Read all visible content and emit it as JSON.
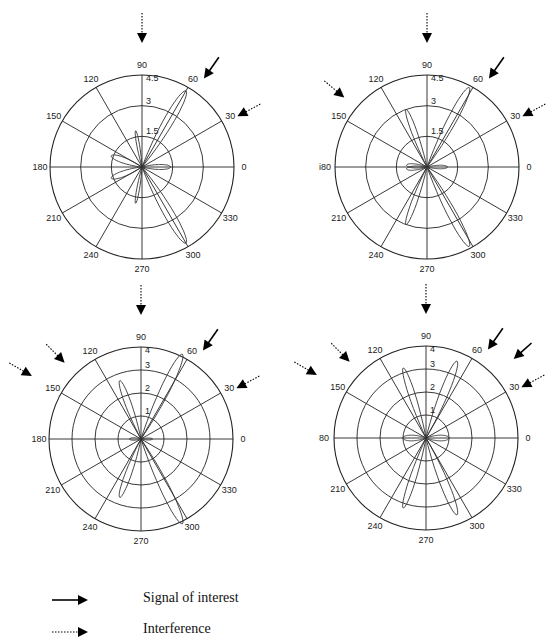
{
  "figure": {
    "legend": [
      {
        "style": "solid",
        "label": "Signal of interest"
      },
      {
        "style": "dotted",
        "label": "Interference"
      }
    ]
  },
  "chart_data": [
    {
      "type": "polar",
      "id": "plot-top-left",
      "center": [
        142,
        167
      ],
      "radius": 92,
      "angle_ticks": [
        "0",
        "30",
        "60",
        "90",
        "120",
        "150",
        "180",
        "210",
        "240",
        "270",
        "300",
        "330"
      ],
      "radial_ticks": [
        "1.5",
        "3",
        "4.5"
      ],
      "rmax": 4.5,
      "arrows": [
        {
          "type": "interference",
          "angle_deg": 90
        },
        {
          "type": "signal",
          "angle_deg": 55
        },
        {
          "type": "interference",
          "angle_deg": 28
        }
      ],
      "lobes": [
        {
          "angle": 60,
          "r": 4.3,
          "width": 9
        },
        {
          "angle": 300,
          "r": 4.3,
          "width": 9
        },
        {
          "angle": 100,
          "r": 1.8,
          "width": 6
        },
        {
          "angle": 260,
          "r": 1.8,
          "width": 6
        },
        {
          "angle": 160,
          "r": 1.6,
          "width": 14
        },
        {
          "angle": 200,
          "r": 1.6,
          "width": 14
        },
        {
          "angle": 0,
          "r": 1.4,
          "width": 14
        }
      ]
    },
    {
      "type": "polar",
      "id": "plot-top-right",
      "center": [
        427,
        167
      ],
      "radius": 92,
      "angle_ticks": [
        "0",
        "30",
        "60",
        "90",
        "120",
        "150",
        "i80",
        "210",
        "240",
        "270",
        "300",
        "330"
      ],
      "radial_ticks": [
        "1.5",
        "3",
        "4.5"
      ],
      "rmax": 4.5,
      "arrows": [
        {
          "type": "interference",
          "angle_deg": 90
        },
        {
          "type": "signal",
          "angle_deg": 55
        },
        {
          "type": "interference",
          "angle_deg": 28
        },
        {
          "type": "interference",
          "angle_deg": 140
        }
      ],
      "lobes": [
        {
          "angle": 62,
          "r": 4.4,
          "width": 8
        },
        {
          "angle": 298,
          "r": 4.4,
          "width": 8
        },
        {
          "angle": 110,
          "r": 3.0,
          "width": 7
        },
        {
          "angle": 250,
          "r": 3.0,
          "width": 7
        },
        {
          "angle": 175,
          "r": 1.0,
          "width": 16
        },
        {
          "angle": 185,
          "r": 1.0,
          "width": 16
        },
        {
          "angle": 0,
          "r": 1.0,
          "width": 14
        }
      ]
    },
    {
      "type": "polar",
      "id": "plot-bottom-left",
      "center": [
        141,
        439
      ],
      "radius": 92,
      "angle_ticks": [
        "0",
        "30",
        "60",
        "90",
        "120",
        "150",
        "180",
        "210",
        "240",
        "270",
        "300",
        "330"
      ],
      "radial_ticks": [
        "1",
        "2",
        "3",
        "4"
      ],
      "rmax": 4,
      "arrows": [
        {
          "type": "interference",
          "angle_deg": 90
        },
        {
          "type": "signal",
          "angle_deg": 55
        },
        {
          "type": "interference",
          "angle_deg": 28
        },
        {
          "type": "interference",
          "angle_deg": 135
        },
        {
          "type": "interference",
          "angle_deg": 150
        }
      ],
      "lobes": [
        {
          "angle": 64,
          "r": 4.1,
          "width": 8
        },
        {
          "angle": 296,
          "r": 4.1,
          "width": 8
        },
        {
          "angle": 110,
          "r": 2.7,
          "width": 8
        },
        {
          "angle": 250,
          "r": 2.7,
          "width": 8
        },
        {
          "angle": 180,
          "r": 0.5,
          "width": 18
        },
        {
          "angle": 0,
          "r": 0.5,
          "width": 14
        }
      ]
    },
    {
      "type": "polar",
      "id": "plot-bottom-right",
      "center": [
        426,
        438
      ],
      "radius": 92,
      "angle_ticks": [
        "0",
        "30",
        "60",
        "90",
        "120",
        "150",
        "80",
        "210",
        "240",
        "270",
        "300",
        "330"
      ],
      "radial_ticks": [
        "1",
        "2",
        "3",
        "4"
      ],
      "rmax": 4,
      "arrows": [
        {
          "type": "interference",
          "angle_deg": 90
        },
        {
          "type": "signal",
          "angle_deg": 55
        },
        {
          "type": "signal",
          "angle_deg": 42
        },
        {
          "type": "interference",
          "angle_deg": 28
        },
        {
          "type": "interference",
          "angle_deg": 135
        },
        {
          "type": "interference",
          "angle_deg": 150
        }
      ],
      "lobes": [
        {
          "angle": 68,
          "r": 3.6,
          "width": 8
        },
        {
          "angle": 292,
          "r": 3.6,
          "width": 8
        },
        {
          "angle": 108,
          "r": 3.2,
          "width": 7
        },
        {
          "angle": 252,
          "r": 3.2,
          "width": 7
        },
        {
          "angle": 180,
          "r": 1.0,
          "width": 20
        },
        {
          "angle": 0,
          "r": 1.0,
          "width": 20
        }
      ]
    }
  ]
}
